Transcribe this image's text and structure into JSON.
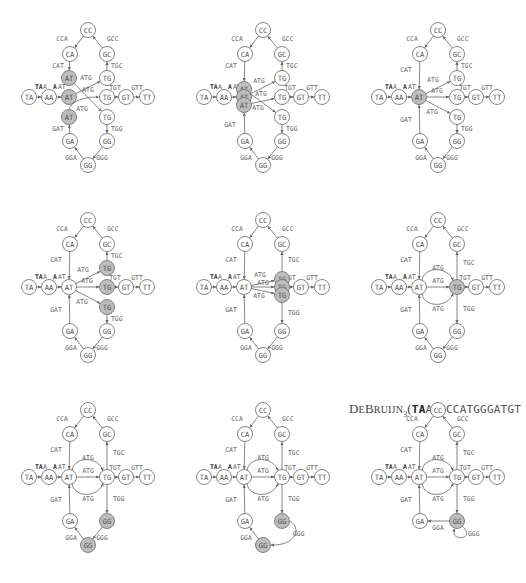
{
  "title": {
    "prefix_D": "D",
    "prefix_e": "E",
    "prefix_B": "B",
    "prefix_ruijn": "RUIJN",
    "subscript": "3",
    "open_paren": "(",
    "bold_part": "TA",
    "rest": "ATGCCATGGGATGT"
  },
  "colors": {
    "node_stroke": "#777777",
    "highlight_fill": "#bdbdbd",
    "edge": "#666666",
    "label": "#666666",
    "start_label": "#333333"
  },
  "base_nodes": {
    "CC": [
      88,
      30
    ],
    "CA": [
      70,
      54
    ],
    "GC": [
      107,
      54
    ],
    "TA": [
      29,
      97
    ],
    "AA": [
      49,
      97
    ],
    "AT": [
      69,
      97
    ],
    "TG": [
      107,
      97
    ],
    "GT": [
      126,
      97
    ],
    "TT": [
      147,
      97
    ],
    "GA": [
      70,
      141
    ],
    "GGr": [
      107,
      141
    ],
    "GGb": [
      88,
      165
    ]
  },
  "panels": [
    {
      "id": "p1",
      "dx": 0,
      "dy": 0,
      "stage": "split",
      "highlight": [
        "AT1",
        "AT2",
        "AT3"
      ]
    },
    {
      "id": "p2",
      "dx": 175,
      "dy": 0,
      "stage": "stacked-AT",
      "highlight": [
        "AT1",
        "AT2",
        "AT3"
      ]
    },
    {
      "id": "p3",
      "dx": 350,
      "dy": 0,
      "stage": "merged-AT",
      "highlight": [
        "AT"
      ]
    },
    {
      "id": "p4",
      "dx": 0,
      "dy": 190,
      "stage": "merged-AT-split-TG",
      "highlight": [
        "TG1",
        "TG2",
        "TG3"
      ]
    },
    {
      "id": "p5",
      "dx": 175,
      "dy": 190,
      "stage": "stacked-TG",
      "highlight": [
        "TG1",
        "TG2",
        "TG3"
      ]
    },
    {
      "id": "p6",
      "dx": 350,
      "dy": 190,
      "stage": "merged-TG",
      "highlight": [
        "TG"
      ]
    },
    {
      "id": "p7",
      "dx": 0,
      "dy": 380,
      "stage": "merged-TG",
      "highlight": [
        "GGr",
        "GGb"
      ]
    },
    {
      "id": "p8",
      "dx": 175,
      "dy": 380,
      "stage": "gg-loop-partial",
      "highlight": [
        "GGr",
        "GGb"
      ]
    },
    {
      "id": "p9",
      "dx": 350,
      "dy": 380,
      "stage": "final",
      "highlight": [
        "GG"
      ]
    }
  ],
  "labels": {
    "TAA": "TA",
    "TAA_tail": "A",
    "AAT_head": "A",
    "AAT_tail": "AT",
    "CCA": "CCA",
    "GCC": "GCC",
    "CAT": "CAT",
    "TGC": "TGC",
    "ATG": "ATG",
    "TGT": "TGT",
    "GTT": "GTT",
    "GAT": "GAT",
    "TGG": "TGG",
    "GGA": "GGA",
    "GGG": "GGG"
  }
}
